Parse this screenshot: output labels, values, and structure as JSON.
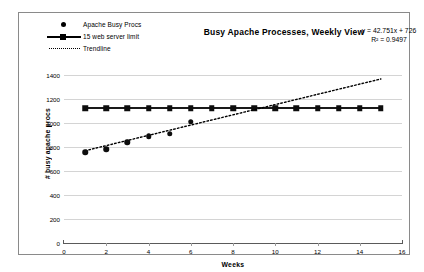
{
  "chart_data": {
    "type": "line",
    "title": "Busy Apache Processes, Weekly View",
    "xlabel": "Weeks",
    "ylabel": "# busy apache procs",
    "xlim": [
      0,
      16
    ],
    "ylim": [
      0,
      1400
    ],
    "xticks": [
      0,
      2,
      4,
      6,
      8,
      10,
      12,
      14,
      16
    ],
    "yticks": [
      0,
      200,
      400,
      600,
      800,
      1000,
      1200,
      1400
    ],
    "grid": true,
    "legend_position": "top-left",
    "annotations": {
      "equation": "y = 42.751x + 726",
      "r_squared": "R² = 0.9497"
    },
    "series": [
      {
        "name": "Apache Busy Procs",
        "marker": "circle",
        "style": "markers",
        "x": [
          1,
          2,
          3,
          4,
          5,
          6
        ],
        "values": [
          755,
          780,
          840,
          890,
          910,
          1010
        ]
      },
      {
        "name": "15 web server limit",
        "marker": "square",
        "style": "line-markers",
        "x": [
          1,
          2,
          3,
          4,
          5,
          6,
          7,
          8,
          9,
          10,
          11,
          12,
          13,
          14,
          15
        ],
        "values": [
          1125,
          1125,
          1125,
          1125,
          1125,
          1125,
          1125,
          1125,
          1125,
          1125,
          1125,
          1125,
          1125,
          1125,
          1125
        ]
      },
      {
        "name": "Trendline",
        "marker": "none",
        "style": "dotted",
        "x": [
          1,
          15
        ],
        "values": [
          769,
          1367
        ]
      }
    ]
  },
  "legend": {
    "items": [
      {
        "label": "Apache Busy Procs",
        "key": "diamond-marker"
      },
      {
        "label": "15 web server limit",
        "key": "square-line-marker"
      },
      {
        "label": "Trendline",
        "key": "dotted-line-marker"
      }
    ]
  }
}
